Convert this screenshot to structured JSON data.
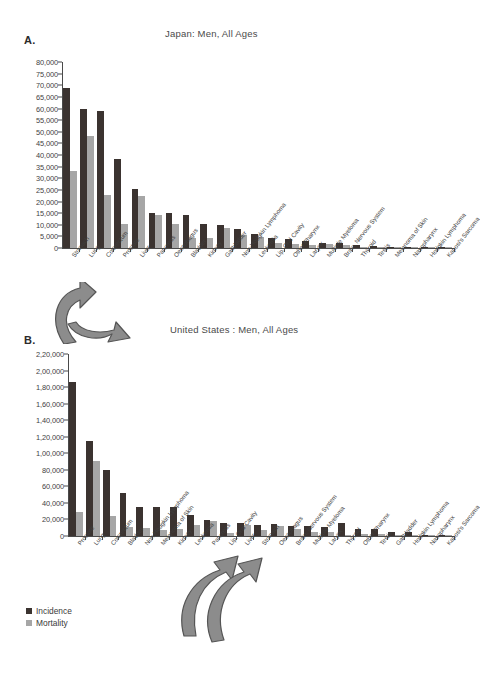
{
  "figure": {
    "legend": {
      "incidence_label": "Incidence",
      "mortality_label": "Mortality"
    },
    "colors": {
      "incidence": "#3b3330",
      "mortality": "#a6a6a6",
      "axis": "#4a4a4a",
      "arrow_fill": "#8c8c8c",
      "arrow_stroke": "#5a5a5a"
    }
  },
  "panels": [
    {
      "letter": "A.",
      "title": "Japan: Men, All Ages"
    },
    {
      "letter": "B.",
      "title": "United States : Men, All Ages"
    }
  ],
  "chart_data": [
    {
      "type": "bar",
      "title": "Japan: Men, All Ages",
      "panel": "A.",
      "xlabel": "",
      "ylabel": "",
      "ylim": [
        0,
        80000
      ],
      "ytick_labels": [
        "80,000",
        "75,000",
        "70,000",
        "65,000",
        "60,000",
        "55,000",
        "50,000",
        "45,000",
        "40,000",
        "35,000",
        "30,000",
        "25,000",
        "20,000",
        "15,000",
        "10,000",
        "5,000",
        "0"
      ],
      "ytick_values": [
        80000,
        75000,
        70000,
        65000,
        60000,
        55000,
        50000,
        45000,
        40000,
        35000,
        30000,
        25000,
        20000,
        15000,
        10000,
        5000,
        0
      ],
      "grid": false,
      "legend_position": "below-panel-b",
      "categories": [
        "Stomach",
        "Lung",
        "Colorectum",
        "Prostate",
        "Liver",
        "Pancreas",
        "Oesophagus",
        "Bladder",
        "Kidney",
        "Gallbladder",
        "Non-Hodgkin Lymphoma",
        "Leukemia",
        "Lip, Oral Cavity",
        "Other Pharynx",
        "Larynx",
        "Multiple Myeloma",
        "Brain, Nervous System",
        "Thyroid",
        "Testis",
        "Melanoma of Skin",
        "Nasopharynx",
        "Hodgkin Lymphoma",
        "Kaposi's Sarcoma"
      ],
      "series": [
        {
          "name": "Incidence",
          "values": [
            69000,
            60000,
            59000,
            38500,
            25500,
            15000,
            15000,
            14000,
            10200,
            10000,
            8200,
            6200,
            4200,
            3900,
            3200,
            2200,
            2300,
            1400,
            700,
            400,
            300,
            250,
            120
          ]
        },
        {
          "name": "Mortality",
          "values": [
            33000,
            48000,
            23000,
            10200,
            22200,
            14400,
            10200,
            4400,
            4500,
            8700,
            5700,
            4800,
            2000,
            1800,
            1100,
            1900,
            1300,
            500,
            200,
            300,
            200,
            150,
            100
          ]
        }
      ]
    },
    {
      "type": "bar",
      "title": "United States : Men, All Ages",
      "panel": "B.",
      "xlabel": "",
      "ylabel": "",
      "ylim": [
        0,
        220000
      ],
      "ytick_labels": [
        "2,20,000",
        "2,00,000",
        "1,80,000",
        "1,60,000",
        "1,40,000",
        "1,20,000",
        "1,00,000",
        "80,000",
        "60,000",
        "40,000",
        "20,000",
        "0"
      ],
      "ytick_values": [
        220000,
        200000,
        180000,
        160000,
        140000,
        120000,
        100000,
        80000,
        60000,
        40000,
        20000,
        0
      ],
      "grid": false,
      "legend_position": "bottom-left",
      "categories": [
        "Prostate",
        "Lung",
        "Colorectum",
        "Bladder",
        "Non-Hodgkin Lymphoma",
        "Melanoma of Skin",
        "Kidney",
        "Leukemia",
        "Pancreas",
        "Lip, Oral Cavity",
        "Liver",
        "Stomach",
        "Oesophagus",
        "Brain, Nervous System",
        "Multiple Myeloma",
        "Larynx",
        "Thyroid",
        "Other Pharynx",
        "Testis",
        "Gallbladder",
        "Hodgkin Lymphoma",
        "Nasopharynx",
        "Kaposi's Sarcoma"
      ],
      "series": [
        {
          "name": "Incidence",
          "values": [
            186000,
            115000,
            80000,
            52000,
            35500,
            35500,
            35500,
            25500,
            19500,
            16000,
            15500,
            13500,
            14000,
            12000,
            12000,
            10500,
            16000,
            8500,
            9000,
            4500,
            5000,
            1500,
            700
          ]
        },
        {
          "name": "Mortality",
          "values": [
            28500,
            90500,
            24500,
            10500,
            10000,
            7500,
            8500,
            13000,
            18000,
            3500,
            13500,
            7000,
            12500,
            8500,
            4500,
            4500,
            1200,
            3000,
            2000,
            1800,
            1000,
            900,
            400
          ]
        }
      ]
    }
  ]
}
